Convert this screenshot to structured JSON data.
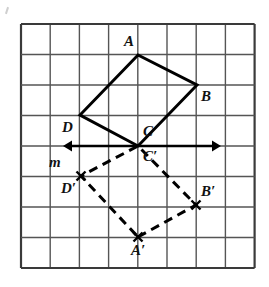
{
  "figure": {
    "background_color": "#ffffff",
    "grid": {
      "line_color": "#555555",
      "border_color": "#3a3a3a",
      "origin_x": 21,
      "origin_y": 24,
      "cell_width": 29.2,
      "cell_height": 30.5,
      "columns": 8,
      "rows": 8
    },
    "styles": {
      "solid_shape_color": "#000000",
      "solid_shape_width": 3,
      "dashed_shape_color": "#000000",
      "dashed_shape_width": 3,
      "dash_pattern": "9,6",
      "mirror_line_color": "#000000",
      "mirror_line_width": 2.6
    },
    "mirror_line": {
      "name": "m",
      "label": "m",
      "label_x": 49,
      "label_y": 155,
      "y": 146,
      "x_start": 63,
      "x_end": 221,
      "arrow_left": true,
      "arrow_right": true
    },
    "preimage": {
      "name": "ABCD",
      "style": "solid",
      "vertices": [
        {
          "label": "A",
          "x": 138,
          "y": 55,
          "label_x": 124,
          "label_y": 34
        },
        {
          "label": "B",
          "x": 197,
          "y": 85,
          "label_x": 201,
          "label_y": 89
        },
        {
          "label": "C",
          "x": 138,
          "y": 146,
          "label_x": 143,
          "label_y": 124
        },
        {
          "label": "D",
          "x": 80,
          "y": 115,
          "label_x": 62,
          "label_y": 120
        }
      ]
    },
    "image": {
      "name": "A'B'C'D'",
      "style": "dashed",
      "vertices": [
        {
          "label": "A′",
          "x": 138,
          "y": 237,
          "label_x": 131,
          "label_y": 243
        },
        {
          "label": "B′",
          "x": 196,
          "y": 205,
          "label_x": 201,
          "label_y": 184
        },
        {
          "label": "C′",
          "x": 138,
          "y": 146,
          "label_x": 143,
          "label_y": 149
        },
        {
          "label": "D′",
          "x": 81,
          "y": 176,
          "label_x": 61,
          "label_y": 181
        }
      ]
    },
    "vertex_markers": {
      "style": "short-tick-cross",
      "shown_for": [
        "A′",
        "B′",
        "D′"
      ]
    }
  }
}
